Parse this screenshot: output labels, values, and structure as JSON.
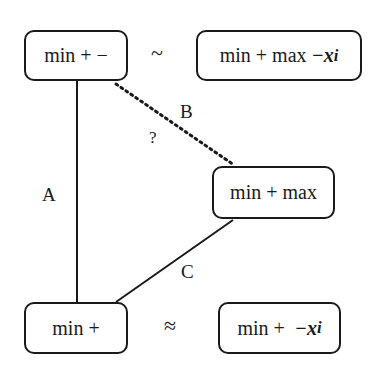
{
  "nodes": {
    "top_left": {
      "text": "min + −"
    },
    "top_right": {
      "text": "min + max ",
      "var": "−x",
      "sub": "i"
    },
    "middle_right": {
      "text": "min + max"
    },
    "bottom_left": {
      "text": "min +"
    },
    "bottom_right": {
      "text": "min +  ",
      "var": "−x",
      "sub": "i"
    }
  },
  "relations": {
    "top": "~",
    "bottom": "≈"
  },
  "edges": {
    "A": {
      "label": "A",
      "style": "solid"
    },
    "B": {
      "label": "B",
      "style": "dotted",
      "annotation": "?"
    },
    "C": {
      "label": "C",
      "style": "solid"
    }
  }
}
